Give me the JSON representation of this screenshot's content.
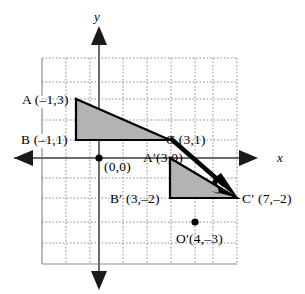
{
  "figure": {
    "kind": "coordinate-plane-translation-diagram",
    "axes": {
      "x_label": "x",
      "y_label": "y",
      "origin_label": "(0,0)"
    },
    "grid": {
      "cell_size_px": 24,
      "x_min": -2.375,
      "x_max": 5.75,
      "y_min": -4.417,
      "y_max": 4.167,
      "line_style": "dotted",
      "color": "#8c8c8c",
      "border_color": "#8c8c8c"
    },
    "colors": {
      "shape_fill": "#b3b3b3",
      "shape_stroke": "#000000",
      "axis": "#6b6b6b",
      "grid": "#8c8c8c",
      "arrow": "#000000"
    },
    "preimage": {
      "name": "ABC",
      "vertices": [
        {
          "key": "A",
          "label": "A (–1,3)",
          "x": -1,
          "y": 3
        },
        {
          "key": "B",
          "label": "B (–1,1)",
          "x": -1,
          "y": 1
        },
        {
          "key": "C",
          "label": "C (3,1)",
          "x": 3,
          "y": 1
        }
      ]
    },
    "image": {
      "name": "A'B'C'",
      "vertices": [
        {
          "key": "A'",
          "label": "A′(3,0)",
          "x": 3,
          "y": 0
        },
        {
          "key": "B'",
          "label": "B′ (3,–2)",
          "x": 3,
          "y": -2
        },
        {
          "key": "C'",
          "label": "C′ (7,–2)",
          "x": 7,
          "y": -2
        }
      ]
    },
    "marked_points": [
      {
        "key": "O",
        "label": "(0,0)",
        "x": 0,
        "y": 0,
        "dot": true
      },
      {
        "key": "O'",
        "label": "O′(4,–3)",
        "x": 4,
        "y": -3,
        "dot": true
      }
    ],
    "translation_arrow": {
      "from": "C",
      "to": "C'",
      "from_point": {
        "x": 3,
        "y": 1
      },
      "to_point": {
        "x": 7,
        "y": -2
      }
    },
    "labels": {
      "A": "A (–1,3)",
      "B": "B (–1,1)",
      "C": "C (3,1)",
      "A_prime": "A′(3,0)",
      "B_prime": "B′ (3,–2)",
      "C_prime": "C′ (7,–2)",
      "O_prime": "O′(4,–3)",
      "origin": "(0,0)",
      "x_axis": "x",
      "y_axis": "y"
    }
  }
}
